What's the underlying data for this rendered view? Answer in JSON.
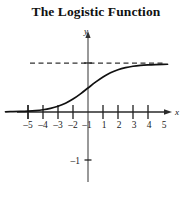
{
  "title": "The Logistic Function",
  "axes": {
    "x_name": "x",
    "y_name": "y"
  },
  "chart_data": {
    "type": "line",
    "title": "The Logistic Function",
    "xlabel": "x",
    "ylabel": "y",
    "grid": false,
    "legend": null,
    "xlim": [
      -5.8,
      5.8
    ],
    "ylim": [
      -1.6,
      1.35
    ],
    "x_ticks": [
      -5,
      -4,
      -3,
      -2,
      -1,
      1,
      2,
      3,
      4,
      5
    ],
    "x_tick_labels": [
      "–5",
      "–4",
      "–3",
      "–2",
      "–1",
      "1",
      "2",
      "3",
      "4",
      "5"
    ],
    "y_ticks": [
      -1,
      1
    ],
    "y_tick_labels": [
      "–1",
      ""
    ],
    "annotations": [
      {
        "name": "horizontal-asymptote",
        "style": "dashed",
        "y": 1,
        "x_from": -3.9,
        "x_to": 5.0
      }
    ],
    "series": [
      {
        "name": "logistic",
        "equation": "y = 1 / (1 + e^(-x))",
        "x": [
          -5.5,
          -5,
          -4.5,
          -4,
          -3.5,
          -3,
          -2.5,
          -2,
          -1.5,
          -1,
          -0.5,
          0,
          0.5,
          1,
          1.5,
          2,
          2.5,
          3,
          3.5,
          4,
          4.5,
          5,
          5.3
        ],
        "y": [
          0.004,
          0.007,
          0.011,
          0.018,
          0.029,
          0.047,
          0.076,
          0.119,
          0.182,
          0.269,
          0.378,
          0.5,
          0.622,
          0.731,
          0.818,
          0.881,
          0.924,
          0.953,
          0.971,
          0.982,
          0.989,
          0.993,
          0.995
        ]
      }
    ]
  }
}
